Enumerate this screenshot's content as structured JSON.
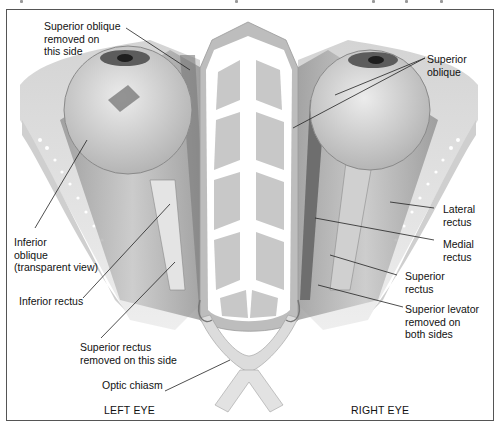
{
  "figure": {
    "colors": {
      "border": "#555555",
      "bone_fill": "#c9c9c9",
      "bone_outline": "#ffffff",
      "muscle": "#a8a8a8",
      "muscle_dark": "#7a7a7a",
      "eyeball": "#d8d8d8",
      "background": "#ffffff",
      "leader_line": "#222222",
      "text": "#111111"
    }
  },
  "labels": {
    "superior_oblique_removed": "Superior oblique\nremoved on\nthis side",
    "superior_oblique": "Superior\noblique",
    "inferior_oblique": "Inferior\noblique\n(transparent view)",
    "lateral_rectus": "Lateral\nrectus",
    "medial_rectus": "Medial\nrectus",
    "superior_rectus": "Superior\nrectus",
    "inferior_rectus": "Inferior rectus",
    "superior_levator": "Superior levator\nremoved on\nboth sides",
    "superior_rectus_removed": "Superior rectus\nremoved on this side",
    "optic_chiasm": "Optic chiasm"
  },
  "captions": {
    "left_eye": "LEFT EYE",
    "right_eye": "RIGHT EYE"
  }
}
